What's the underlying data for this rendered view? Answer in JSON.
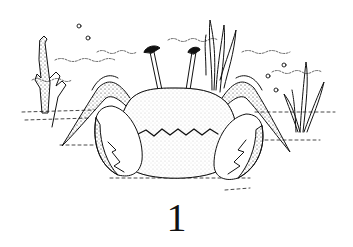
{
  "illustration": {
    "subject": "crab",
    "style": "black-and-white pen drawing with stippling",
    "elements": [
      "crab",
      "seaweed-left",
      "seaweed-center",
      "seaweed-right",
      "bubbles",
      "water-ripples",
      "sandy-ground"
    ],
    "ink_color": "#111111",
    "background_color": "#ffffff"
  },
  "caption": {
    "number": "1"
  }
}
